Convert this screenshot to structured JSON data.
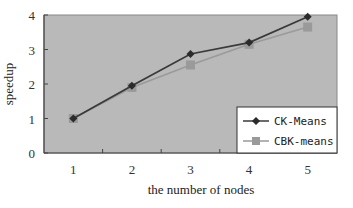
{
  "chart_data": {
    "type": "line",
    "title": "",
    "xlabel": "the number of nodes",
    "ylabel": "speedup",
    "categories": [
      "1",
      "2",
      "3",
      "4",
      "5"
    ],
    "x": [
      1,
      2,
      3,
      4,
      5
    ],
    "ylim": [
      0,
      4
    ],
    "yticks": [
      "0",
      "1",
      "2",
      "3",
      "4"
    ],
    "grid": false,
    "legend_position": "lower right",
    "plot_background": "#b8b8b8",
    "series": [
      {
        "name": "CK-Means",
        "values": [
          1.0,
          1.95,
          2.87,
          3.2,
          3.95
        ],
        "color": "#3a3a3a",
        "marker": "diamond"
      },
      {
        "name": "CBK-means",
        "values": [
          1.0,
          1.9,
          2.55,
          3.15,
          3.65
        ],
        "color": "#9a9a9a",
        "marker": "square"
      }
    ]
  }
}
